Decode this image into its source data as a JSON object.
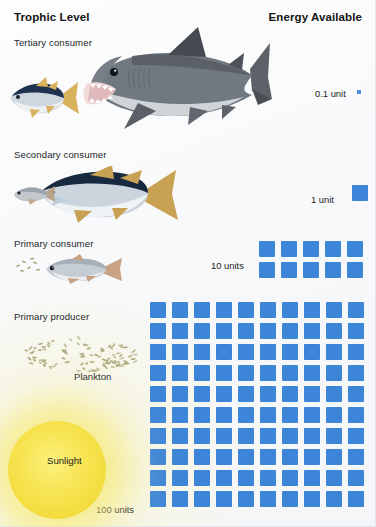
{
  "header": {
    "left_title": "Trophic Level",
    "right_title": "Energy Available"
  },
  "trophic_levels": [
    {
      "id": "tertiary",
      "label": "Tertiary consumer",
      "organism": "shark",
      "energy_label": "0.1 unit",
      "energy_units": 0.1,
      "squares": 1
    },
    {
      "id": "secondary",
      "label": "Secondary consumer",
      "organism": "tuna",
      "energy_label": "1 unit",
      "energy_units": 1,
      "squares": 1
    },
    {
      "id": "primary-consumer",
      "label": "Primary consumer",
      "organism": "small-fish",
      "energy_label": "10 units",
      "energy_units": 10,
      "squares": 10,
      "grid_columns": 5,
      "grid_rows": 2
    },
    {
      "id": "primary-producer",
      "label": "Primary producer",
      "organism": "plankton",
      "sub_label": "Plankton",
      "energy_label": "100 units",
      "energy_units": 100,
      "squares": 100,
      "grid_columns": 10,
      "grid_rows": 10
    }
  ],
  "sun": {
    "label": "Sunlight",
    "energy_label": "100 units"
  },
  "colors": {
    "energy_square": "#3d85d8",
    "energy_square_small": "#4a90e2",
    "sun_core": "#f7e451",
    "sun_glow": "#f6e978",
    "text": "#1b1b1b",
    "background": "#f7f8fa"
  },
  "chart_data": {
    "type": "bar",
    "xlabel": "Trophic Level",
    "ylabel": "Energy Available",
    "categories": [
      "Primary producer",
      "Primary consumer",
      "Secondary consumer",
      "Tertiary consumer"
    ],
    "values": [
      100,
      10,
      1,
      0.1
    ],
    "value_labels": [
      "100 units",
      "10 units",
      "1 unit",
      "0.1 unit"
    ],
    "unit_symbol": "blue square = 1 unit",
    "source_label": "Sunlight",
    "source_value": 100,
    "grid": false,
    "legend": "none"
  }
}
